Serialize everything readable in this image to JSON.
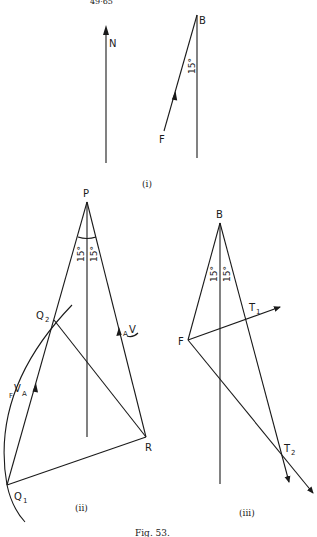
{
  "header": {
    "page_ref": "49·65"
  },
  "figure": {
    "caption": "Fig. 53."
  },
  "panels": [
    {
      "id": "i",
      "label": "(i)",
      "labels": {
        "north": "N",
        "b": "B",
        "f": "F",
        "angle": "15°"
      }
    },
    {
      "id": "ii",
      "label": "(ii)",
      "labels": {
        "p": "P",
        "q2": "Q",
        "q2_sub": "2",
        "q1": "Q",
        "q1_sub": "1",
        "r": "R",
        "fva_pre": "F",
        "fva_main": "V",
        "fva_sub": "A",
        "av_pre": "A",
        "av_main": "V",
        "angle_left": "15°",
        "angle_right": "15°"
      }
    },
    {
      "id": "iii",
      "label": "(iii)",
      "labels": {
        "b": "B",
        "f": "F",
        "t1": "T",
        "t1_sub": "1",
        "t2": "T",
        "t2_sub": "2",
        "angle_left": "15°",
        "angle_right": "15°"
      }
    }
  ]
}
